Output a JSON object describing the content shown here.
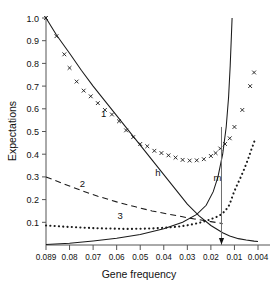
{
  "chart_data": {
    "type": "line",
    "title": "",
    "xlabel": "Gene frequency",
    "ylabel": "Expectations",
    "xtick_labels": [
      "0.089",
      "0.08",
      "0.07",
      "0.06",
      "0.05",
      "0.04",
      "0.03",
      "0.02",
      "0.01",
      "0.004"
    ],
    "xtick_values": [
      0.089,
      0.08,
      0.07,
      0.06,
      0.05,
      0.04,
      0.03,
      0.02,
      0.01,
      0.004
    ],
    "ytick_labels": [
      "0.1",
      "0.2",
      "0.3",
      "0.4",
      "0.5",
      "0.6",
      "0.7",
      "0.8",
      "0.9",
      "1.0"
    ],
    "ytick_values": [
      0.1,
      0.2,
      0.3,
      0.4,
      0.5,
      0.6,
      0.7,
      0.8,
      0.9,
      1.0
    ],
    "ylim": [
      0.0,
      1.0
    ],
    "x_axis_direction": "decreasing",
    "grid": false,
    "legend": "inline-labels",
    "annotations": [
      {
        "text": "1",
        "x": 0.0655,
        "y": 0.565,
        "describes": "series-1-markers"
      },
      {
        "text": "2",
        "x": 0.0745,
        "y": 0.255,
        "describes": "series-2-dashed"
      },
      {
        "text": "3",
        "x": 0.0585,
        "y": 0.115,
        "describes": "series-3-dotted"
      },
      {
        "text": "h",
        "x": 0.0425,
        "y": 0.305,
        "describes": "curve-h"
      },
      {
        "text": "m",
        "x": 0.0172,
        "y": 0.283,
        "describes": "curve-m"
      }
    ],
    "vertical_marker": {
      "x": 0.0155,
      "y_top": 0.52,
      "y_bottom": 0.0,
      "arrow": "down"
    },
    "series": [
      {
        "name": "1",
        "style": "markers",
        "marker": "x",
        "x": [
          0.089,
          0.085,
          0.082,
          0.08,
          0.077,
          0.074,
          0.071,
          0.068,
          0.065,
          0.062,
          0.059,
          0.056,
          0.053,
          0.05,
          0.047,
          0.044,
          0.041,
          0.038,
          0.035,
          0.032,
          0.029,
          0.026,
          0.023,
          0.02,
          0.018,
          0.016,
          0.014,
          0.012,
          0.01,
          0.008,
          0.006,
          0.005
        ],
        "y": [
          1.0,
          0.92,
          0.84,
          0.78,
          0.72,
          0.68,
          0.655,
          0.625,
          0.595,
          0.575,
          0.545,
          0.505,
          0.475,
          0.445,
          0.435,
          0.415,
          0.405,
          0.395,
          0.385,
          0.375,
          0.372,
          0.373,
          0.378,
          0.392,
          0.405,
          0.425,
          0.445,
          0.47,
          0.52,
          0.595,
          0.7,
          0.76
        ]
      },
      {
        "name": "h",
        "style": "solid-line",
        "x": [
          0.089,
          0.085,
          0.08,
          0.075,
          0.07,
          0.065,
          0.06,
          0.055,
          0.05,
          0.045,
          0.04,
          0.035,
          0.03,
          0.025,
          0.02,
          0.015,
          0.012,
          0.009,
          0.007,
          0.005,
          0.004
        ],
        "y": [
          1.0,
          0.925,
          0.845,
          0.77,
          0.7,
          0.635,
          0.57,
          0.505,
          0.44,
          0.375,
          0.31,
          0.245,
          0.18,
          0.128,
          0.086,
          0.054,
          0.04,
          0.028,
          0.022,
          0.017,
          0.015
        ]
      },
      {
        "name": "m",
        "style": "solid-line",
        "x": [
          0.089,
          0.08,
          0.07,
          0.06,
          0.05,
          0.04,
          0.032,
          0.026,
          0.022,
          0.019,
          0.017,
          0.015,
          0.0135,
          0.0125,
          0.0118,
          0.0113,
          0.011
        ],
        "y": [
          0.002,
          0.008,
          0.018,
          0.03,
          0.046,
          0.072,
          0.1,
          0.135,
          0.175,
          0.235,
          0.3,
          0.4,
          0.52,
          0.65,
          0.79,
          0.92,
          1.0
        ]
      },
      {
        "name": "2",
        "style": "dashed-line",
        "x": [
          0.089,
          0.082,
          0.075,
          0.068,
          0.06,
          0.052,
          0.045,
          0.038,
          0.032,
          0.027,
          0.023,
          0.02,
          0.017,
          0.015
        ],
        "y": [
          0.3,
          0.268,
          0.24,
          0.215,
          0.19,
          0.168,
          0.15,
          0.136,
          0.124,
          0.115,
          0.108,
          0.103,
          0.098,
          0.094
        ]
      },
      {
        "name": "3",
        "style": "dotted-line",
        "x": [
          0.089,
          0.085,
          0.081,
          0.077,
          0.073,
          0.069,
          0.065,
          0.061,
          0.057,
          0.053,
          0.049,
          0.045,
          0.041,
          0.037,
          0.033,
          0.03,
          0.027,
          0.024,
          0.021,
          0.019,
          0.017,
          0.0155,
          0.014,
          0.0125,
          0.0115,
          0.0105,
          0.0095,
          0.0085,
          0.0075,
          0.0065,
          0.0058,
          0.0052,
          0.0047
        ],
        "y": [
          0.086,
          0.083,
          0.08,
          0.078,
          0.076,
          0.074,
          0.073,
          0.072,
          0.071,
          0.071,
          0.072,
          0.073,
          0.075,
          0.078,
          0.082,
          0.087,
          0.093,
          0.1,
          0.11,
          0.118,
          0.126,
          0.135,
          0.15,
          0.17,
          0.195,
          0.225,
          0.258,
          0.295,
          0.335,
          0.38,
          0.415,
          0.443,
          0.468
        ]
      }
    ],
    "colors": {
      "line": "#1a1a1a",
      "marker": "#1a1a1a",
      "axis": "#555555",
      "text": "#111111",
      "background": "#ffffff"
    }
  }
}
